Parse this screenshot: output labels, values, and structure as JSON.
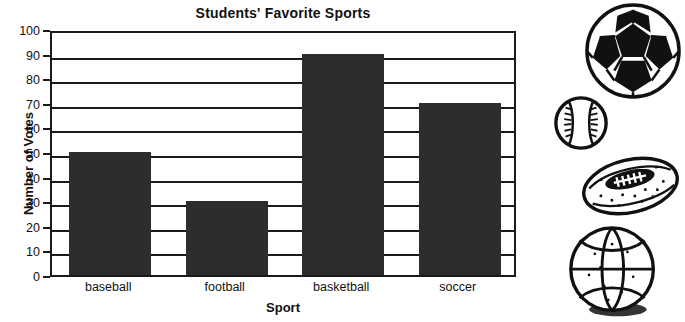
{
  "chart_data": {
    "type": "bar",
    "title": "Students' Favorite Sports",
    "xlabel": "Sport",
    "ylabel": "Number of Votes",
    "categories": [
      "baseball",
      "football",
      "basketball",
      "soccer"
    ],
    "values": [
      50,
      30,
      90,
      70
    ],
    "ylim": [
      0,
      100
    ],
    "ytick_step": 10,
    "yticks": [
      "100",
      "90",
      "80",
      "70",
      "60",
      "50",
      "40",
      "30",
      "20",
      "10",
      "0"
    ],
    "grid": true,
    "grid_axis": "y",
    "legend": "none",
    "bar_color": "#2d2d2d",
    "axis_color": "#1a1a1a",
    "background": "#ffffff"
  },
  "illustrations": [
    {
      "name": "soccer-ball-illustration",
      "label": "soccer ball"
    },
    {
      "name": "baseball-illustration",
      "label": "baseball"
    },
    {
      "name": "football-illustration",
      "label": "football"
    },
    {
      "name": "basketball-illustration",
      "label": "basketball"
    }
  ]
}
